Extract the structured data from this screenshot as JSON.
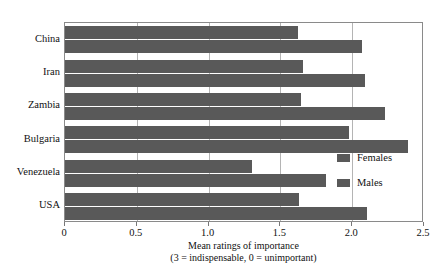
{
  "chart_data": {
    "type": "bar",
    "orientation": "horizontal",
    "title": "",
    "xlabel": "Mean ratings of importance",
    "xlabel_line2": "(3 = indispensable, 0 = unimportant)",
    "ylabel": "",
    "categories": [
      "China",
      "Iran",
      "Zambia",
      "Bulgaria",
      "Venezuela",
      "USA"
    ],
    "series": [
      {
        "name": "Females",
        "values": [
          1.62,
          1.66,
          1.64,
          1.98,
          1.3,
          1.63
        ]
      },
      {
        "name": "Males",
        "values": [
          2.07,
          2.09,
          2.23,
          2.39,
          1.82,
          2.1
        ]
      }
    ],
    "xlim": [
      0,
      2.5
    ],
    "xticks": [
      0,
      0.5,
      1.0,
      1.5,
      2.0,
      2.5
    ],
    "xtick_labels": [
      "0",
      "0.5",
      "1.0",
      "1.5",
      "2.0",
      "2.5"
    ],
    "grid": true,
    "grid_axis": "x",
    "legend_position": "inside-right",
    "colors": {
      "bar_fill": "#595959",
      "frame": "#8a8a8a",
      "gridline": "#b4b4b4",
      "background": "#ffffff",
      "text": "#111111"
    }
  },
  "legend": {
    "items": [
      {
        "label": "Females",
        "color": "#595959"
      },
      {
        "label": "Males",
        "color": "#595959"
      }
    ]
  }
}
